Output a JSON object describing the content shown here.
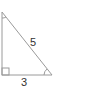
{
  "diagram": {
    "type": "right-triangle",
    "labels": {
      "hypotenuse": "5",
      "base": "3"
    },
    "colors": {
      "stroke": "#9a9a9a",
      "text": "#333333"
    }
  }
}
